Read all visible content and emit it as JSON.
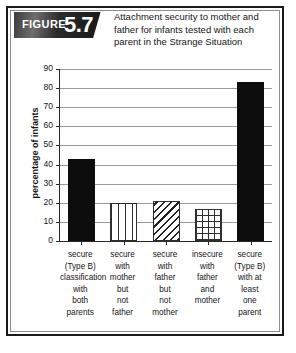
{
  "figure": {
    "badge_word": "FIGURE",
    "badge_number": "5.7",
    "title": "Attachment security to mother and father for infants tested with each parent in the Strange Situation"
  },
  "colors": {
    "frame": "#1a1a1a",
    "badge_background": "#171717",
    "bar_solid": "#0d0d0d",
    "gridline": "#9a9a9a",
    "axis": "#2a2a2a",
    "text": "#151515"
  },
  "chart_data": {
    "type": "bar",
    "title": "Attachment security to mother and father for infants tested with each parent in the Strange Situation",
    "xlabel": "",
    "ylabel": "percentage of infants",
    "ylim": [
      0,
      90
    ],
    "yticks": [
      0,
      10,
      20,
      30,
      40,
      50,
      60,
      70,
      80,
      90
    ],
    "ytick_labels": [
      "0",
      "10",
      "20",
      "30",
      "40",
      "50",
      "60",
      "70",
      "80",
      "90"
    ],
    "grid": true,
    "legend": "none",
    "categories": [
      "secure\n(Type B)\nclassification\nwith\nboth\nparents",
      "secure\nwith\nmother\nbut\nnot\nfather",
      "secure\nwith\nfather\nbut\nnot\nmother",
      "insecure\nwith\nfather\nand\nmother",
      "secure\n(Type B)\nwith at\nleast\none\nparent"
    ],
    "category_lines": [
      [
        "secure",
        "(Type B)",
        "classification",
        "with",
        "both",
        "parents"
      ],
      [
        "secure",
        "with",
        "mother",
        "but",
        "not",
        "father"
      ],
      [
        "secure",
        "with",
        "father",
        "but",
        "not",
        "mother"
      ],
      [
        "insecure",
        "with",
        "father",
        "and",
        "mother"
      ],
      [
        "secure",
        "(Type B)",
        "with at",
        "least",
        "one",
        "parent"
      ]
    ],
    "values": [
      43,
      20,
      21,
      17,
      83
    ],
    "patterns": [
      "solid",
      "vertical-stripes",
      "diagonal-stripes",
      "crosshatch",
      "solid"
    ]
  }
}
